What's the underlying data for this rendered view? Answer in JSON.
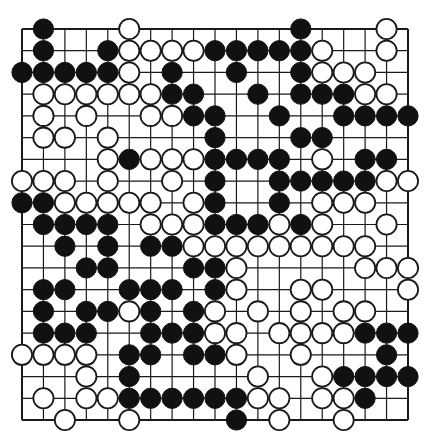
{
  "board": {
    "size": 19,
    "colors": {
      "line": "#1a1a1a",
      "black": "#111111",
      "white": "#ffffff",
      "background": "#ffffff"
    },
    "black": [
      [
        0,
        1
      ],
      [
        0,
        13
      ],
      [
        1,
        1
      ],
      [
        1,
        4
      ],
      [
        1,
        9
      ],
      [
        1,
        10
      ],
      [
        1,
        11
      ],
      [
        1,
        12
      ],
      [
        1,
        13
      ],
      [
        2,
        0
      ],
      [
        2,
        1
      ],
      [
        2,
        2
      ],
      [
        2,
        3
      ],
      [
        2,
        4
      ],
      [
        2,
        7
      ],
      [
        2,
        10
      ],
      [
        2,
        13
      ],
      [
        3,
        7
      ],
      [
        3,
        8
      ],
      [
        3,
        11
      ],
      [
        3,
        13
      ],
      [
        3,
        14
      ],
      [
        3,
        15
      ],
      [
        4,
        8
      ],
      [
        4,
        9
      ],
      [
        4,
        12
      ],
      [
        4,
        15
      ],
      [
        4,
        16
      ],
      [
        4,
        17
      ],
      [
        4,
        18
      ],
      [
        5,
        9
      ],
      [
        5,
        13
      ],
      [
        5,
        14
      ],
      [
        6,
        5
      ],
      [
        6,
        9
      ],
      [
        6,
        10
      ],
      [
        6,
        11
      ],
      [
        6,
        12
      ],
      [
        6,
        16
      ],
      [
        6,
        17
      ],
      [
        7,
        9
      ],
      [
        7,
        12
      ],
      [
        7,
        13
      ],
      [
        7,
        14
      ],
      [
        7,
        15
      ],
      [
        7,
        16
      ],
      [
        8,
        0
      ],
      [
        8,
        1
      ],
      [
        8,
        9
      ],
      [
        8,
        12
      ],
      [
        9,
        1
      ],
      [
        9,
        2
      ],
      [
        9,
        3
      ],
      [
        9,
        4
      ],
      [
        9,
        9
      ],
      [
        9,
        10
      ],
      [
        9,
        11
      ],
      [
        9,
        13
      ],
      [
        10,
        2
      ],
      [
        10,
        4
      ],
      [
        10,
        6
      ],
      [
        10,
        7
      ],
      [
        11,
        3
      ],
      [
        11,
        4
      ],
      [
        11,
        8
      ],
      [
        11,
        9
      ],
      [
        12,
        1
      ],
      [
        12,
        2
      ],
      [
        12,
        5
      ],
      [
        12,
        6
      ],
      [
        12,
        7
      ],
      [
        12,
        9
      ],
      [
        13,
        1
      ],
      [
        13,
        3
      ],
      [
        13,
        4
      ],
      [
        13,
        6
      ],
      [
        13,
        8
      ],
      [
        14,
        1
      ],
      [
        14,
        2
      ],
      [
        14,
        3
      ],
      [
        14,
        6
      ],
      [
        14,
        7
      ],
      [
        14,
        8
      ],
      [
        14,
        16
      ],
      [
        14,
        17
      ],
      [
        14,
        18
      ],
      [
        15,
        5
      ],
      [
        15,
        6
      ],
      [
        15,
        8
      ],
      [
        15,
        9
      ],
      [
        15,
        17
      ],
      [
        16,
        5
      ],
      [
        16,
        15
      ],
      [
        16,
        16
      ],
      [
        16,
        17
      ],
      [
        16,
        18
      ],
      [
        17,
        5
      ],
      [
        17,
        6
      ],
      [
        17,
        7
      ],
      [
        17,
        8
      ],
      [
        17,
        9
      ],
      [
        17,
        10
      ],
      [
        17,
        16
      ],
      [
        18,
        10
      ]
    ],
    "white": [
      [
        0,
        5
      ],
      [
        0,
        17
      ],
      [
        1,
        5
      ],
      [
        1,
        6
      ],
      [
        1,
        7
      ],
      [
        1,
        8
      ],
      [
        1,
        14
      ],
      [
        1,
        17
      ],
      [
        2,
        5
      ],
      [
        2,
        14
      ],
      [
        2,
        15
      ],
      [
        2,
        16
      ],
      [
        3,
        1
      ],
      [
        3,
        2
      ],
      [
        3,
        3
      ],
      [
        3,
        4
      ],
      [
        3,
        5
      ],
      [
        3,
        6
      ],
      [
        3,
        16
      ],
      [
        3,
        17
      ],
      [
        4,
        1
      ],
      [
        4,
        3
      ],
      [
        4,
        6
      ],
      [
        4,
        7
      ],
      [
        5,
        1
      ],
      [
        5,
        2
      ],
      [
        5,
        4
      ],
      [
        6,
        4
      ],
      [
        6,
        6
      ],
      [
        6,
        7
      ],
      [
        6,
        8
      ],
      [
        6,
        14
      ],
      [
        7,
        0
      ],
      [
        7,
        1
      ],
      [
        7,
        2
      ],
      [
        7,
        4
      ],
      [
        7,
        7
      ],
      [
        7,
        17
      ],
      [
        7,
        18
      ],
      [
        8,
        2
      ],
      [
        8,
        3
      ],
      [
        8,
        4
      ],
      [
        8,
        5
      ],
      [
        8,
        6
      ],
      [
        8,
        8
      ],
      [
        8,
        14
      ],
      [
        8,
        15
      ],
      [
        8,
        16
      ],
      [
        9,
        6
      ],
      [
        9,
        7
      ],
      [
        9,
        8
      ],
      [
        9,
        12
      ],
      [
        9,
        14
      ],
      [
        9,
        17
      ],
      [
        10,
        8
      ],
      [
        10,
        9
      ],
      [
        10,
        10
      ],
      [
        10,
        11
      ],
      [
        10,
        12
      ],
      [
        10,
        13
      ],
      [
        10,
        14
      ],
      [
        10,
        15
      ],
      [
        10,
        16
      ],
      [
        11,
        10
      ],
      [
        11,
        16
      ],
      [
        11,
        17
      ],
      [
        11,
        18
      ],
      [
        12,
        10
      ],
      [
        12,
        13
      ],
      [
        12,
        14
      ],
      [
        12,
        18
      ],
      [
        13,
        5
      ],
      [
        13,
        9
      ],
      [
        13,
        11
      ],
      [
        13,
        13
      ],
      [
        13,
        15
      ],
      [
        13,
        16
      ],
      [
        14,
        9
      ],
      [
        14,
        10
      ],
      [
        14,
        12
      ],
      [
        14,
        13
      ],
      [
        14,
        14
      ],
      [
        14,
        15
      ],
      [
        15,
        0
      ],
      [
        15,
        1
      ],
      [
        15,
        2
      ],
      [
        15,
        3
      ],
      [
        15,
        10
      ],
      [
        15,
        13
      ],
      [
        16,
        3
      ],
      [
        16,
        11
      ],
      [
        16,
        14
      ],
      [
        17,
        1
      ],
      [
        17,
        3
      ],
      [
        17,
        4
      ],
      [
        17,
        11
      ],
      [
        17,
        12
      ],
      [
        17,
        14
      ],
      [
        17,
        15
      ],
      [
        18,
        2
      ],
      [
        18,
        5
      ],
      [
        18,
        12
      ],
      [
        18,
        15
      ]
    ]
  }
}
